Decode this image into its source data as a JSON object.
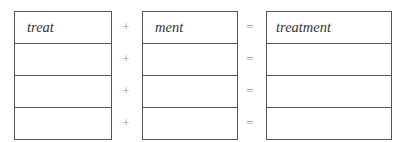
{
  "rows": [
    {
      "part1": "treat",
      "plus": "+",
      "part2": "ment",
      "equals": "=",
      "result": "treatment"
    },
    {
      "part1": "",
      "plus": "+",
      "part2": "",
      "equals": "=",
      "result": ""
    },
    {
      "part1": "",
      "plus": "+",
      "part2": "",
      "equals": "=",
      "result": ""
    },
    {
      "part1": "",
      "plus": "+",
      "part2": "",
      "equals": "=",
      "result": ""
    }
  ]
}
